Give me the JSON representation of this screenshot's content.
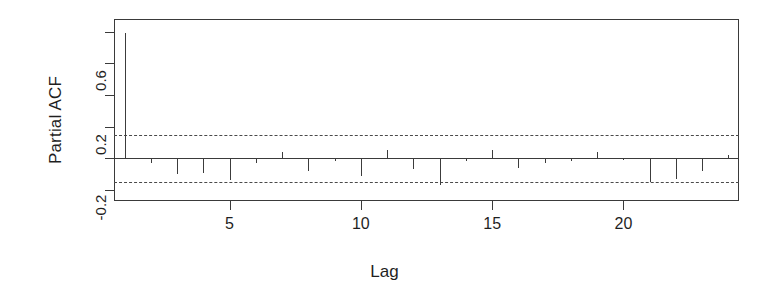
{
  "chart_data": {
    "type": "bar",
    "title": "",
    "subtitle": "",
    "xlabel": "Lag",
    "ylabel": "Partial ACF",
    "x": [
      1,
      2,
      3,
      4,
      5,
      6,
      7,
      8,
      9,
      10,
      11,
      12,
      13,
      14,
      15,
      16,
      17,
      18,
      19,
      20,
      21,
      22,
      23,
      24
    ],
    "values": [
      0.79,
      -0.03,
      -0.1,
      -0.09,
      -0.14,
      -0.03,
      0.04,
      -0.08,
      -0.02,
      -0.11,
      0.05,
      -0.07,
      -0.17,
      -0.02,
      0.05,
      -0.06,
      -0.03,
      -0.02,
      0.04,
      -0.01,
      -0.15,
      -0.13,
      -0.08,
      0.02
    ],
    "xlim": [
      0.6,
      24.4
    ],
    "ylim": [
      -0.27,
      0.88
    ],
    "xticks": [
      5,
      10,
      15,
      20
    ],
    "xtick_labels": [
      "5",
      "10",
      "15",
      "20"
    ],
    "yticks": [
      -0.2,
      0.0,
      0.2,
      0.4,
      0.6,
      0.8
    ],
    "ytick_labels": [
      "-0.2",
      "",
      "0.2",
      "",
      "0.6",
      ""
    ],
    "confidence_bounds": [
      0.147,
      -0.147
    ],
    "grid": false,
    "legend": null,
    "line_color": "#3c3c3c",
    "conf_color": "#4a4a4a",
    "axis_color": "#3a3a3a",
    "background": "#ffffff"
  }
}
